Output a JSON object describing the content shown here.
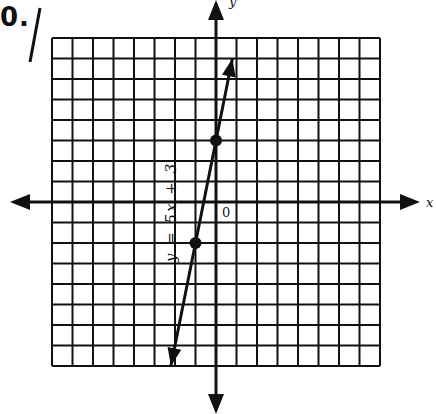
{
  "problem": {
    "number": "0.",
    "equation": "y = 5x + 3"
  },
  "axes": {
    "x_label": "x",
    "y_label": "y",
    "origin_label": "0"
  },
  "grid": {
    "x_min": -8,
    "x_max": 8,
    "y_min": -8,
    "y_max": 8,
    "cell_size_px": 20.5,
    "color": "#111111"
  },
  "chart_data": {
    "type": "line",
    "title": "",
    "xlabel": "x",
    "ylabel": "y",
    "xlim": [
      -8,
      8
    ],
    "ylim": [
      -8,
      8
    ],
    "grid": true,
    "series": [
      {
        "name": "y = 5x + 3",
        "slope": 5,
        "intercept": 3,
        "x": [
          -2.2,
          0.8
        ],
        "y": [
          -8,
          7
        ],
        "marked_points": [
          {
            "x": 0,
            "y": 3
          },
          {
            "x": -1,
            "y": -2
          }
        ]
      }
    ],
    "annotations": [
      "y = 5x + 3",
      "0"
    ]
  }
}
